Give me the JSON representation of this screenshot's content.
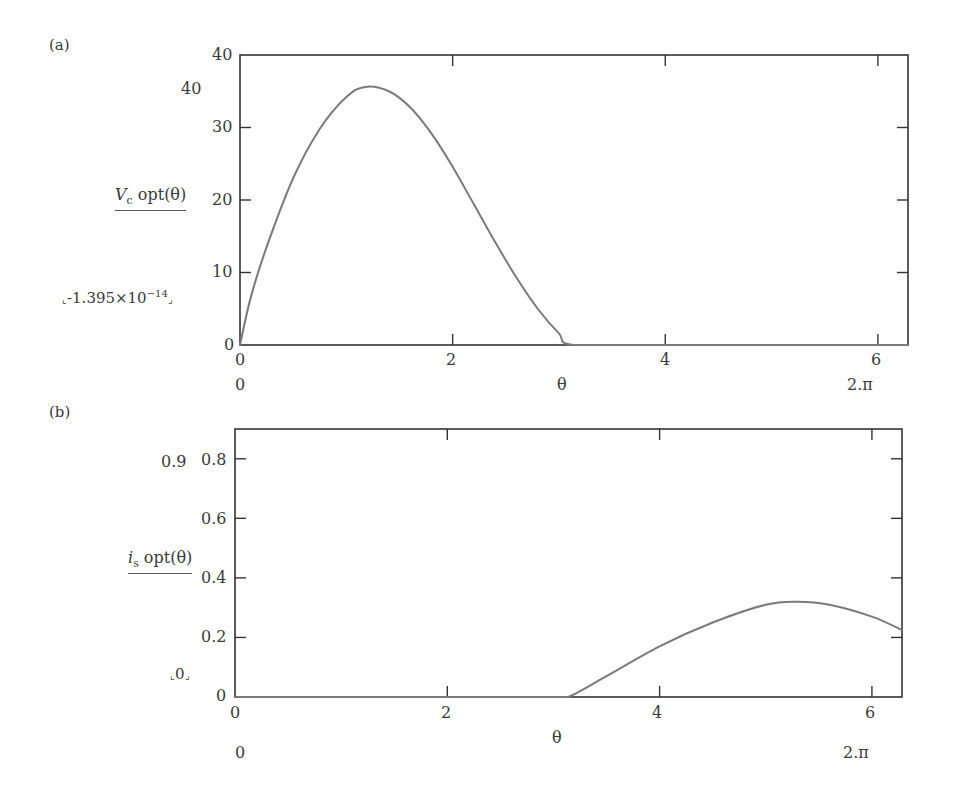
{
  "panels": [
    {
      "id": "a",
      "panel_label": "(a)",
      "ylabel_main": "V",
      "ylabel_sub": "c",
      "ylabel_rest": " opt(θ)",
      "y_top_extra": "40",
      "y_bottom_extra": "-1.395×10",
      "y_bottom_extra_exp": "−14",
      "x_left_extra": "0",
      "x_var": "θ",
      "x_right_extra": "2.π",
      "y_ticks": [
        "0",
        "10",
        "20",
        "30",
        "40"
      ],
      "x_ticks": [
        "0",
        "2",
        "4",
        "6"
      ]
    },
    {
      "id": "b",
      "panel_label": "(b)",
      "ylabel_main": "i",
      "ylabel_sub": "s",
      "ylabel_rest": " opt(θ)",
      "y_top_extra": "0.9",
      "y_bottom_extra": "0",
      "x_left_extra": "0",
      "x_var": "θ",
      "x_right_extra": "2.π",
      "y_ticks": [
        "0",
        "0.2",
        "0.4",
        "0.6",
        "0.8"
      ],
      "x_ticks": [
        "0",
        "2",
        "4",
        "6"
      ]
    }
  ],
  "chart_data": [
    {
      "type": "line",
      "title": "(a)",
      "xlabel": "θ",
      "ylabel": "Vc opt(θ)",
      "xlim": [
        0,
        6.2832
      ],
      "ylim": [
        0,
        40
      ],
      "grid": false,
      "x_ticks": [
        0,
        2,
        4,
        6
      ],
      "y_ticks": [
        0,
        10,
        20,
        30,
        40
      ],
      "series": [
        {
          "name": "Vc opt(θ)",
          "x": [
            0,
            0.1,
            0.25,
            0.5,
            0.75,
            1.0,
            1.18,
            1.4,
            1.6,
            1.8,
            2.0,
            2.2,
            2.4,
            2.6,
            2.8,
            3.0,
            3.14,
            4.0,
            5.0,
            6.2832
          ],
          "values": [
            0,
            6.5,
            13.5,
            23.0,
            29.8,
            34.2,
            35.6,
            35.0,
            32.8,
            29.2,
            24.6,
            19.4,
            14.2,
            9.3,
            5.0,
            1.6,
            0,
            0,
            0,
            0
          ]
        }
      ],
      "annotations": [
        "40",
        "-1.395×10^-14",
        "0",
        "2.π"
      ]
    },
    {
      "type": "line",
      "title": "(b)",
      "xlabel": "θ",
      "ylabel": "is opt(θ)",
      "xlim": [
        0,
        6.2832
      ],
      "ylim": [
        0,
        0.9
      ],
      "grid": false,
      "x_ticks": [
        0,
        2,
        4,
        6
      ],
      "y_ticks": [
        0,
        0.2,
        0.4,
        0.6,
        0.8
      ],
      "series": [
        {
          "name": "is opt(θ)",
          "x": [
            0,
            1.0,
            2.0,
            3.0,
            3.14,
            3.5,
            4.0,
            4.5,
            5.0,
            5.3,
            5.6,
            6.0,
            6.2832
          ],
          "values": [
            0,
            0,
            0,
            0,
            0,
            0.07,
            0.17,
            0.25,
            0.31,
            0.32,
            0.31,
            0.27,
            0.225
          ]
        }
      ],
      "annotations": [
        "0.9",
        "0",
        "0",
        "2.π"
      ]
    }
  ]
}
